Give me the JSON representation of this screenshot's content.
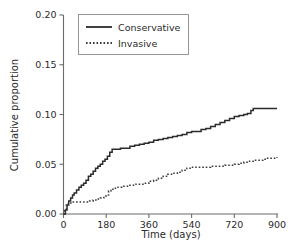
{
  "chart_data": {
    "type": "line",
    "title": "",
    "subtitle": "",
    "xlabel": "Time (days)",
    "ylabel": "Cumulative proportion",
    "xlim": [
      0,
      900
    ],
    "ylim": [
      0.0,
      0.2
    ],
    "xticks": [
      0,
      180,
      360,
      540,
      720,
      900
    ],
    "xticklabels": [
      "0",
      "180",
      "360",
      "540",
      "720",
      "900"
    ],
    "yticks": [
      0.0,
      0.05,
      0.1,
      0.15,
      0.2
    ],
    "yticklabels": [
      "0.00",
      "0.05",
      "0.10",
      "0.15",
      "0.20"
    ],
    "grid": false,
    "legend_position": "top-left",
    "legend_entries": [
      "Conservative",
      "Invasive"
    ],
    "series": [
      {
        "name": "Conservative",
        "style": "solid",
        "color": "#2b2b2b",
        "x": [
          0,
          8,
          15,
          22,
          30,
          38,
          45,
          55,
          65,
          75,
          85,
          95,
          105,
          115,
          125,
          135,
          145,
          155,
          165,
          175,
          185,
          195,
          205,
          220,
          240,
          260,
          280,
          300,
          320,
          340,
          360,
          380,
          400,
          420,
          440,
          460,
          480,
          500,
          520,
          540,
          560,
          580,
          600,
          620,
          640,
          660,
          680,
          700,
          720,
          740,
          760,
          775,
          790,
          800,
          830,
          860,
          900
        ],
        "y": [
          0.0,
          0.004,
          0.009,
          0.013,
          0.016,
          0.019,
          0.021,
          0.024,
          0.027,
          0.029,
          0.031,
          0.034,
          0.038,
          0.04,
          0.043,
          0.046,
          0.048,
          0.05,
          0.053,
          0.055,
          0.058,
          0.062,
          0.065,
          0.065,
          0.066,
          0.066,
          0.068,
          0.069,
          0.07,
          0.071,
          0.072,
          0.074,
          0.075,
          0.076,
          0.077,
          0.078,
          0.079,
          0.08,
          0.082,
          0.083,
          0.083,
          0.085,
          0.086,
          0.088,
          0.09,
          0.092,
          0.094,
          0.096,
          0.098,
          0.099,
          0.1,
          0.101,
          0.104,
          0.106,
          0.106,
          0.106,
          0.106
        ]
      },
      {
        "name": "Invasive",
        "style": "dotted",
        "color": "#3a3a3a",
        "x": [
          0,
          5,
          12,
          20,
          35,
          55,
          75,
          95,
          110,
          125,
          140,
          155,
          170,
          180,
          190,
          200,
          215,
          230,
          245,
          260,
          275,
          290,
          305,
          320,
          340,
          360,
          380,
          400,
          420,
          440,
          460,
          480,
          500,
          520,
          540,
          560,
          580,
          600,
          620,
          640,
          660,
          680,
          700,
          720,
          740,
          760,
          780,
          800,
          820,
          840,
          860,
          880,
          900
        ],
        "y": [
          0.0,
          0.004,
          0.009,
          0.011,
          0.012,
          0.012,
          0.012,
          0.012,
          0.013,
          0.014,
          0.015,
          0.016,
          0.018,
          0.019,
          0.023,
          0.025,
          0.026,
          0.027,
          0.028,
          0.028,
          0.029,
          0.029,
          0.03,
          0.03,
          0.031,
          0.033,
          0.034,
          0.036,
          0.038,
          0.04,
          0.041,
          0.042,
          0.044,
          0.046,
          0.047,
          0.047,
          0.047,
          0.047,
          0.048,
          0.048,
          0.048,
          0.049,
          0.049,
          0.05,
          0.051,
          0.052,
          0.053,
          0.054,
          0.054,
          0.055,
          0.056,
          0.056,
          0.057
        ]
      }
    ]
  }
}
